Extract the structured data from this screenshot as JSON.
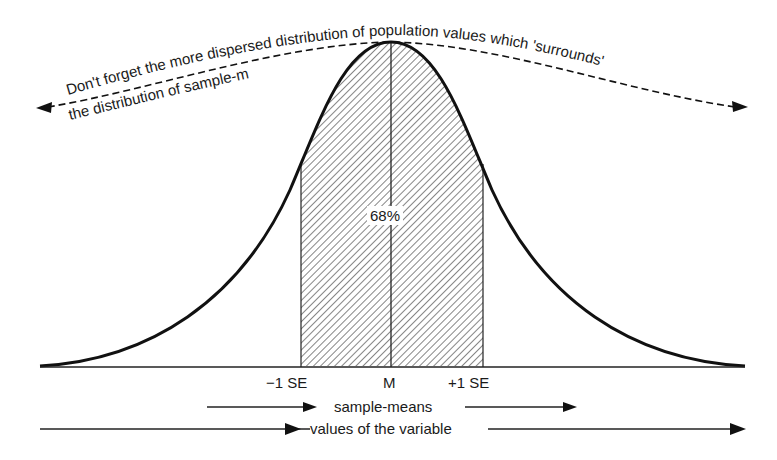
{
  "diagram": {
    "type": "normal-distribution-sampling",
    "annotation": {
      "line1": "Don't forget the more dispersed distribution of population values which 'surrounds'",
      "line2": "the distribution of sample-means"
    },
    "shaded_area_label": "68%",
    "axis_labels": {
      "minus_se": "−1 SE",
      "mean": "M",
      "plus_se": "+1 SE"
    },
    "arrows": {
      "sample_means": "sample-means",
      "values": "values of the variable"
    },
    "colors": {
      "ink": "#1a1a1a",
      "background": "#ffffff"
    }
  }
}
